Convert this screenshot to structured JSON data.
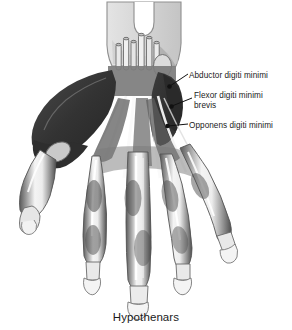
{
  "figure": {
    "caption": "Hypothenars",
    "background_color": "#ffffff"
  },
  "labels": [
    {
      "id": "abductor-digiti-minimi",
      "line1": "Abductor digiti minimi",
      "line2": "",
      "marker_color": "#111111",
      "leader_color": "#111111"
    },
    {
      "id": "flexor-digiti-minimi-brevis",
      "line1": "Flexor digiti minimi",
      "line2": "brevis",
      "marker_color": "#111111",
      "leader_color": "#111111"
    },
    {
      "id": "opponens-digiti-minimi",
      "line1": "Opponens digiti minimi",
      "line2": "",
      "marker_color": "#111111",
      "leader_color": "#111111"
    }
  ],
  "anatomy": {
    "forearm_fill": "#d2d2d2",
    "forearm_outline": "#8a8a8a",
    "palm_fill": "#b9b9b9",
    "muscle_dark_fill": "#3a3a3a",
    "muscle_mid_fill": "#6e6e6e",
    "tendon_fill": "#f2f2f2",
    "bone_fill": "#e8e8e8",
    "outline": "#4a4a4a",
    "structures": [
      "forearm stump with V-notch",
      "cut flexor tendon stumps at wrist",
      "pisiform bone",
      "thenar eminence",
      "hypothenar eminence",
      "palmar aponeurosis tendons",
      "metacarpal bones",
      "proximal phalanges",
      "middle phalanges",
      "distal phalanges with heart-shaped tufts",
      "thumb"
    ]
  }
}
